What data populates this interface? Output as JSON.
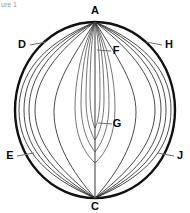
{
  "figure": {
    "title_fragment": "ure 1",
    "type": "sphere-meridian-diagram",
    "colors": {
      "outline": "#111111",
      "meridian": "#2b2b2b",
      "axis": "#4a4a4a",
      "leader": "#6f6f6f",
      "label": "#0b0b0b",
      "background": "#ffffff"
    },
    "geometry": {
      "center_x": 95,
      "center_y": 110,
      "radius_x": 80,
      "radius_y": 88,
      "pole_top_y": 22,
      "pole_bottom_y": 198
    },
    "labels": [
      {
        "id": "A",
        "text": "A",
        "x": 95,
        "y": 11,
        "anchor": "middle",
        "leader": false,
        "desc": "top-pole-label"
      },
      {
        "id": "C",
        "text": "C",
        "x": 95,
        "y": 207,
        "anchor": "middle",
        "leader": false,
        "desc": "bottom-pole-label"
      },
      {
        "id": "D",
        "text": "D",
        "x": 22,
        "y": 45,
        "anchor": "middle",
        "leader": true,
        "lx1": 30,
        "ly1": 45,
        "lx2": 46,
        "ly2": 42,
        "desc": "upper-left-meridian-label"
      },
      {
        "id": "E",
        "text": "E",
        "x": 10,
        "y": 156,
        "anchor": "middle",
        "leader": true,
        "lx1": 17,
        "ly1": 156,
        "lx2": 34,
        "ly2": 153,
        "desc": "lower-left-meridian-label"
      },
      {
        "id": "F",
        "text": "F",
        "x": 116,
        "y": 51,
        "anchor": "middle",
        "leader": true,
        "lx1": 111,
        "ly1": 51,
        "lx2": 97,
        "ly2": 50,
        "desc": "upper-center-lens-label"
      },
      {
        "id": "G",
        "text": "G",
        "x": 117,
        "y": 124,
        "anchor": "middle",
        "leader": true,
        "lx1": 112,
        "ly1": 124,
        "lx2": 98,
        "ly2": 123,
        "desc": "lower-center-lens-label"
      },
      {
        "id": "H",
        "text": "H",
        "x": 169,
        "y": 45,
        "anchor": "middle",
        "leader": true,
        "lx1": 162,
        "ly1": 45,
        "lx2": 146,
        "ly2": 42,
        "desc": "upper-right-meridian-label"
      },
      {
        "id": "J",
        "text": "J",
        "x": 180,
        "y": 156,
        "anchor": "middle",
        "leader": true,
        "lx1": 174,
        "ly1": 156,
        "lx2": 158,
        "ly2": 153,
        "desc": "lower-right-meridian-label"
      }
    ],
    "meridian_half_widths_left": [
      76,
      71,
      66,
      60,
      41,
      20,
      14,
      9,
      4
    ],
    "meridian_half_widths_right": [
      76,
      71,
      66,
      60,
      41,
      20,
      14,
      9,
      4
    ],
    "meridian_count_total": 18,
    "axis_label": "A-C polar axis"
  }
}
